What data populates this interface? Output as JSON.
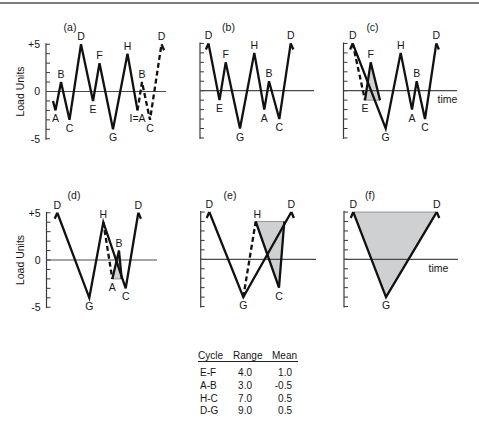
{
  "figure": {
    "panels": [
      {
        "id": "a",
        "title": "(a)",
        "title_pos": [
          70,
          30.5
        ],
        "axis": {
          "x": 46,
          "zero_y": 91.5,
          "unit": 9.45,
          "h_end": 166
        },
        "y_ticks": [
          {
            "text": "+5",
            "value": 5
          },
          {
            "text": "0",
            "value": 0
          },
          {
            "text": "-5",
            "value": -5
          }
        ],
        "y_label": "Load Units",
        "y_label_x": 24,
        "x_label": null,
        "points": [
          {
            "id": "s",
            "x": 53,
            "load": -1,
            "label": "",
            "pos": "none"
          },
          {
            "id": "A1",
            "x": 55.5,
            "load": -2,
            "label": "A",
            "pos": "below"
          },
          {
            "id": "B1",
            "x": 61,
            "load": 1,
            "label": "B",
            "pos": "above"
          },
          {
            "id": "C1",
            "x": 69.5,
            "load": -3,
            "label": "C",
            "pos": "below"
          },
          {
            "id": "D1",
            "x": 81,
            "load": 5,
            "label": "D",
            "pos": "above"
          },
          {
            "id": "E",
            "x": 93,
            "load": -1,
            "label": "E",
            "pos": "below"
          },
          {
            "id": "F",
            "x": 99.5,
            "load": 3,
            "label": "F",
            "pos": "above"
          },
          {
            "id": "G",
            "x": 113,
            "load": -4,
            "label": "G",
            "pos": "below"
          },
          {
            "id": "H",
            "x": 127.5,
            "load": 4,
            "label": "H",
            "pos": "above"
          },
          {
            "id": "A2",
            "x": 137.5,
            "load": -2,
            "label": "I=A",
            "pos": "below"
          },
          {
            "id": "B2",
            "x": 142,
            "load": 1,
            "label": "B",
            "pos": "above"
          },
          {
            "id": "C2",
            "x": 150,
            "load": -3,
            "label": "C",
            "pos": "below"
          },
          {
            "id": "D2",
            "x": 161.5,
            "load": 5,
            "label": "D",
            "pos": "above",
            "stub": "end"
          }
        ],
        "paths": [
          {
            "style": "solid",
            "pts": [
              "s",
              "A1",
              "B1",
              "C1",
              "D1",
              "E",
              "F",
              "G",
              "H",
              "A2"
            ]
          },
          {
            "style": "dashed",
            "pts": [
              "A2",
              "B2",
              "C2",
              "D2"
            ]
          }
        ],
        "shade": null
      },
      {
        "id": "b",
        "title": "(b)",
        "title_pos": [
          228.5,
          30.5
        ],
        "axis": {
          "x": 200,
          "zero_y": 90.7,
          "unit": 9.45,
          "h_end": 314
        },
        "y_ticks": [],
        "y_label": null,
        "x_label": null,
        "points": [
          {
            "id": "D1",
            "x": 208.5,
            "load": 5,
            "label": "D",
            "pos": "above",
            "stub": "start"
          },
          {
            "id": "E",
            "x": 219.5,
            "load": -1,
            "label": "E",
            "pos": "below"
          },
          {
            "id": "F",
            "x": 225.7,
            "load": 3,
            "label": "F",
            "pos": "above"
          },
          {
            "id": "G",
            "x": 240,
            "load": -4,
            "label": "G",
            "pos": "below"
          },
          {
            "id": "H",
            "x": 254.3,
            "load": 4,
            "label": "H",
            "pos": "above"
          },
          {
            "id": "A",
            "x": 264.3,
            "load": -2,
            "label": "A",
            "pos": "below"
          },
          {
            "id": "B",
            "x": 269,
            "load": 1,
            "label": "B",
            "pos": "above"
          },
          {
            "id": "C",
            "x": 279.3,
            "load": -3,
            "label": "C",
            "pos": "below"
          },
          {
            "id": "D2",
            "x": 290.7,
            "load": 5,
            "label": "D",
            "pos": "above",
            "stub": "end"
          }
        ],
        "paths": [
          {
            "style": "solid",
            "pts": [
              "D1",
              "E",
              "F",
              "G",
              "H",
              "A",
              "B",
              "C",
              "D2"
            ]
          }
        ],
        "shade": null
      },
      {
        "id": "c",
        "title": "(c)",
        "title_pos": [
          372.5,
          30.5
        ],
        "axis": {
          "x": 343.5,
          "zero_y": 90.7,
          "unit": 9.45,
          "h_end": 457
        },
        "y_ticks": [],
        "y_label": null,
        "x_label": "time",
        "x_label_pos": [
          447.5,
          103
        ],
        "points": [
          {
            "id": "D1",
            "x": 352.7,
            "load": 5,
            "label": "D",
            "pos": "above",
            "stub": "start"
          },
          {
            "id": "E",
            "x": 365,
            "load": -1,
            "label": "E",
            "pos": "below"
          },
          {
            "id": "F",
            "x": 370.7,
            "load": 3,
            "label": "F",
            "pos": "above"
          },
          {
            "id": "E2",
            "x": 380,
            "load": -1,
            "label": "",
            "pos": "none"
          },
          {
            "id": "G",
            "x": 385.7,
            "load": -4,
            "label": "G",
            "pos": "below"
          },
          {
            "id": "H",
            "x": 400.7,
            "load": 4,
            "label": "H",
            "pos": "above"
          },
          {
            "id": "A",
            "x": 412,
            "load": -2,
            "label": "A",
            "pos": "below"
          },
          {
            "id": "B",
            "x": 416.7,
            "load": 1,
            "label": "B",
            "pos": "above"
          },
          {
            "id": "C",
            "x": 425,
            "load": -3,
            "label": "C",
            "pos": "below"
          },
          {
            "id": "D2",
            "x": 436.3,
            "load": 5,
            "label": "D",
            "pos": "above",
            "stub": "end"
          }
        ],
        "paths": [
          {
            "style": "dashed",
            "pts": [
              "D1",
              "E"
            ]
          },
          {
            "style": "solid",
            "pts": [
              "E",
              "F",
              "E2"
            ]
          },
          {
            "style": "solid",
            "pts": [
              "D1",
              "G",
              "H",
              "A",
              "B",
              "C",
              "D2"
            ]
          }
        ],
        "shade": [
          "E",
          "F",
          "E2"
        ]
      },
      {
        "id": "d",
        "title": "(d)",
        "title_pos": [
          74,
          198.5
        ],
        "axis": {
          "x": 46.5,
          "zero_y": 260,
          "unit": 9.45,
          "h_end": 157
        },
        "y_ticks": [
          {
            "text": "+5",
            "value": 5
          },
          {
            "text": "0",
            "value": 0
          },
          {
            "text": "-5",
            "value": -5
          }
        ],
        "y_label": "Load Units",
        "y_label_x": 24,
        "x_label": null,
        "points": [
          {
            "id": "D1",
            "x": 57.3,
            "load": 5,
            "label": "D",
            "pos": "above",
            "stub": "start"
          },
          {
            "id": "G",
            "x": 89.3,
            "load": -4,
            "label": "G",
            "pos": "below"
          },
          {
            "id": "H",
            "x": 103.3,
            "load": 4,
            "label": "H",
            "pos": "above"
          },
          {
            "id": "A",
            "x": 112.3,
            "load": -2,
            "label": "A",
            "pos": "below"
          },
          {
            "id": "B",
            "x": 119,
            "load": 1,
            "label": "B",
            "pos": "above"
          },
          {
            "id": "A2",
            "x": 121.7,
            "load": -2,
            "label": "",
            "pos": "none"
          },
          {
            "id": "C",
            "x": 125.7,
            "load": -3,
            "label": "C",
            "pos": "below"
          },
          {
            "id": "D2",
            "x": 138.3,
            "load": 5,
            "label": "D",
            "pos": "above",
            "stub": "end"
          }
        ],
        "paths": [
          {
            "style": "solid",
            "pts": [
              "D1",
              "G",
              "H",
              "C",
              "D2"
            ]
          },
          {
            "style": "dashed",
            "pts": [
              "H",
              "A"
            ]
          },
          {
            "style": "solid",
            "pts": [
              "A",
              "B",
              "A2"
            ]
          }
        ],
        "shade": [
          "A",
          "B",
          "A2"
        ]
      },
      {
        "id": "e",
        "title": "(e)",
        "title_pos": [
          230,
          198.5
        ],
        "axis": {
          "x": 200.7,
          "zero_y": 259.3,
          "unit": 9.45,
          "h_end": 316
        },
        "y_ticks": [],
        "y_label": null,
        "x_label": null,
        "points": [
          {
            "id": "D1",
            "x": 209.3,
            "load": 5,
            "label": "D",
            "pos": "above",
            "stub": "start"
          },
          {
            "id": "G",
            "x": 243.3,
            "load": -4,
            "label": "G",
            "pos": "below"
          },
          {
            "id": "H",
            "x": 255.7,
            "load": 4,
            "label": "H",
            "pos": "above",
            "dx": 1.5
          },
          {
            "id": "C",
            "x": 279,
            "load": -3,
            "label": "C",
            "pos": "below"
          },
          {
            "id": "H2",
            "x": 284.3,
            "load": 4,
            "label": "",
            "pos": "none"
          },
          {
            "id": "D2",
            "x": 291.3,
            "load": 5,
            "label": "D",
            "pos": "above",
            "stub": "end"
          }
        ],
        "paths": [
          {
            "style": "solid",
            "pts": [
              "D1",
              "G",
              "D2"
            ]
          },
          {
            "style": "dashed",
            "pts": [
              "G",
              "H"
            ]
          },
          {
            "style": "solid",
            "pts": [
              "H",
              "C",
              "H2"
            ]
          }
        ],
        "shade": [
          "H",
          "C",
          "H2"
        ]
      },
      {
        "id": "f",
        "title": "(f)",
        "title_pos": [
          370,
          198.5
        ],
        "axis": {
          "x": 344,
          "zero_y": 259.3,
          "unit": 9.45,
          "h_end": 458
        },
        "y_ticks": [],
        "y_label": null,
        "x_label": "time",
        "x_label_pos": [
          438.5,
          272
        ],
        "points": [
          {
            "id": "D1",
            "x": 353.3,
            "load": 5,
            "label": "D",
            "pos": "above",
            "stub": "start"
          },
          {
            "id": "G",
            "x": 386,
            "load": -4,
            "label": "G",
            "pos": "below"
          },
          {
            "id": "D2",
            "x": 436.7,
            "load": 5,
            "label": "D",
            "pos": "above",
            "stub": "end"
          }
        ],
        "paths": [
          {
            "style": "solid",
            "pts": [
              "D1",
              "G",
              "D2"
            ]
          }
        ],
        "shade": [
          "D1",
          "G",
          "D2"
        ]
      }
    ]
  },
  "table": {
    "headers": {
      "cycle": "Cycle",
      "range": "Range",
      "mean": "Mean"
    },
    "rows": [
      {
        "cycle": "E-F",
        "range": "4.0",
        "mean": "1.0"
      },
      {
        "cycle": "A-B",
        "range": "3.0",
        "mean": "-0.5"
      },
      {
        "cycle": "H-C",
        "range": "7.0",
        "mean": "0.5"
      },
      {
        "cycle": "D-G",
        "range": "9.0",
        "mean": "0.5"
      }
    ]
  },
  "chart_data": {
    "type": "line",
    "title": "",
    "ylabel": "Load Units",
    "xlabel": "time",
    "ylim": [
      -5,
      5
    ],
    "yticks": [
      "+5",
      "0",
      "-5"
    ],
    "grid": false,
    "panels": [
      {
        "label": "(a)",
        "sequence": [
          "A",
          "B",
          "C",
          "D",
          "E",
          "F",
          "G",
          "H",
          "I=A",
          "B",
          "C",
          "D"
        ],
        "values": [
          -2,
          1,
          -3,
          5,
          -1,
          3,
          -4,
          4,
          -2,
          1,
          -3,
          5
        ],
        "note": "segment I=A to D dashed (repeat)"
      },
      {
        "label": "(b)",
        "sequence": [
          "D",
          "E",
          "F",
          "G",
          "H",
          "A",
          "B",
          "C",
          "D"
        ],
        "values": [
          5,
          -1,
          3,
          -4,
          4,
          -2,
          1,
          -3,
          5
        ]
      },
      {
        "label": "(c)",
        "sequence": [
          "D",
          "G",
          "H",
          "A",
          "B",
          "C",
          "D"
        ],
        "values": [
          5,
          -4,
          4,
          -2,
          1,
          -3,
          5
        ],
        "removed_cycle": {
          "name": "E-F",
          "values": [
            -1,
            3
          ],
          "shaded": true
        }
      },
      {
        "label": "(d)",
        "sequence": [
          "D",
          "G",
          "H",
          "C",
          "D"
        ],
        "values": [
          5,
          -4,
          4,
          -3,
          5
        ],
        "removed_cycle": {
          "name": "A-B",
          "values": [
            -2,
            1
          ],
          "shaded": true
        }
      },
      {
        "label": "(e)",
        "sequence": [
          "D",
          "G",
          "D"
        ],
        "values": [
          5,
          -4,
          5
        ],
        "removed_cycle": {
          "name": "H-C",
          "values": [
            4,
            -3
          ],
          "shaded": true
        }
      },
      {
        "label": "(f)",
        "sequence": [
          "D",
          "G",
          "D"
        ],
        "values": [
          5,
          -4,
          5
        ],
        "removed_cycle": {
          "name": "D-G",
          "values": [
            5,
            -4
          ],
          "shaded": true
        }
      }
    ],
    "table": {
      "columns": [
        "Cycle",
        "Range",
        "Mean"
      ],
      "rows": [
        [
          "E-F",
          4.0,
          1.0
        ],
        [
          "A-B",
          3.0,
          -0.5
        ],
        [
          "H-C",
          7.0,
          0.5
        ],
        [
          "D-G",
          9.0,
          0.5
        ]
      ]
    }
  }
}
